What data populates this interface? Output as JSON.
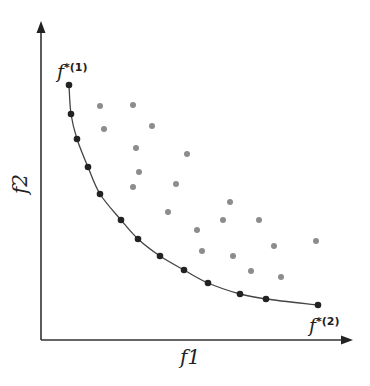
{
  "chart_data": {
    "type": "scatter",
    "title": "",
    "xlabel": "f1",
    "ylabel": "f2",
    "grid": false,
    "legend": null,
    "annotations": [
      {
        "text": "f*(1)",
        "base": "f",
        "sup": "*(1)",
        "at": "top-left end of Pareto front"
      },
      {
        "text": "f*(2)",
        "base": "f",
        "sup": "*(2)",
        "at": "bottom-right end of Pareto front"
      }
    ],
    "axes_px": {
      "origin": [
        41,
        340
      ],
      "x_end": [
        352,
        340
      ],
      "y_end": [
        41,
        22
      ]
    },
    "series": [
      {
        "name": "pareto_front",
        "color": "#222222",
        "marker": "circle",
        "connected": true,
        "points_px": [
          [
            69,
            85
          ],
          [
            71,
            114
          ],
          [
            77,
            139
          ],
          [
            88,
            167
          ],
          [
            100,
            194
          ],
          [
            121,
            220
          ],
          [
            138,
            239
          ],
          [
            160,
            256
          ],
          [
            184,
            270
          ],
          [
            208,
            283
          ],
          [
            240,
            294
          ],
          [
            266,
            299
          ],
          [
            318,
            305
          ]
        ]
      },
      {
        "name": "dominated_solutions",
        "color": "#8c8c8c",
        "marker": "circle",
        "connected": false,
        "points_px": [
          [
            100,
            106
          ],
          [
            133,
            105
          ],
          [
            104,
            129
          ],
          [
            152,
            126
          ],
          [
            136,
            148
          ],
          [
            187,
            154
          ],
          [
            139,
            172
          ],
          [
            133,
            187
          ],
          [
            176,
            184
          ],
          [
            168,
            212
          ],
          [
            230,
            202
          ],
          [
            223,
            220
          ],
          [
            259,
            220
          ],
          [
            197,
            230
          ],
          [
            202,
            251
          ],
          [
            233,
            256
          ],
          [
            274,
            246
          ],
          [
            316,
            241
          ],
          [
            251,
            271
          ],
          [
            281,
            277
          ]
        ]
      }
    ]
  },
  "labels": {
    "x_axis": "f1",
    "y_axis": "f2",
    "ideal1_base": "f",
    "ideal1_sup": "*(1)",
    "ideal2_base": "f",
    "ideal2_sup": "*(2)"
  },
  "colors": {
    "axis": "#333333",
    "front": "#222222",
    "dominated": "#8c8c8c"
  }
}
